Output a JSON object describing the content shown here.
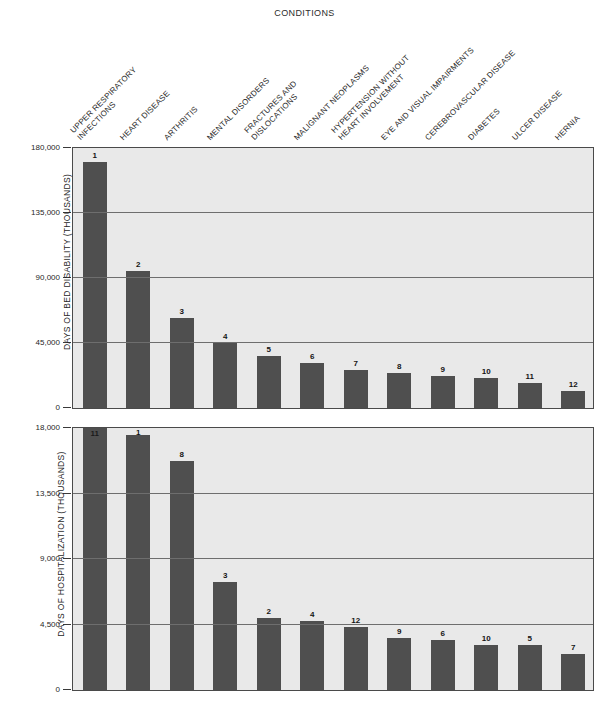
{
  "chart_title": "CONDITIONS",
  "categories": [
    {
      "rank": 1,
      "lines": [
        "UPPER RESPIRATORY",
        "INFECTIONS"
      ]
    },
    {
      "rank": 2,
      "lines": [
        "HEART DISEASE"
      ]
    },
    {
      "rank": 3,
      "lines": [
        "ARTHRITIS"
      ]
    },
    {
      "rank": 4,
      "lines": [
        "MENTAL DISORDERS"
      ]
    },
    {
      "rank": 5,
      "lines": [
        "FRACTURES AND",
        "DISLOCATIONS"
      ]
    },
    {
      "rank": 6,
      "lines": [
        "MALIGNANT NEOPLASMS"
      ]
    },
    {
      "rank": 7,
      "lines": [
        "HYPERTENSION WITHOUT",
        "HEART INVOLVEMENT"
      ]
    },
    {
      "rank": 8,
      "lines": [
        "EYE AND VISUAL IMPAIRMENTS"
      ]
    },
    {
      "rank": 9,
      "lines": [
        "CEREBROVASCULAR DISEASE"
      ]
    },
    {
      "rank": 10,
      "lines": [
        "DIABETES"
      ]
    },
    {
      "rank": 11,
      "lines": [
        "ULCER DISEASE"
      ]
    },
    {
      "rank": 12,
      "lines": [
        "HERNIA"
      ]
    }
  ],
  "colors": {
    "bar": "#4f4f4f",
    "plot_background": "#e9e9e9",
    "gridline": "#6e6e6e",
    "frame": "#4a4a4a",
    "text": "#1a1a1a"
  },
  "chart_data": [
    {
      "type": "bar",
      "id": "bed-disability",
      "title": "CONDITIONS",
      "xlabel": "CONDITIONS",
      "ylabel": "DAYS OF BED DISABILITY (THOUSANDS)",
      "ylim": [
        0,
        180000
      ],
      "yticks": [
        0,
        45000,
        90000,
        135000,
        180000
      ],
      "ytick_labels": [
        "0",
        "45,000",
        "90,000",
        "135,000",
        "180,000"
      ],
      "grid": true,
      "legend": "none",
      "categories": [
        "UPPER RESPIRATORY INFECTIONS",
        "HEART DISEASE",
        "ARTHRITIS",
        "MENTAL DISORDERS",
        "FRACTURES AND DISLOCATIONS",
        "MALIGNANT NEOPLASMS",
        "HYPERTENSION WITHOUT HEART INVOLVEMENT",
        "EYE AND VISUAL IMPAIRMENTS",
        "CEREBROVASCULAR DISEASE",
        "DIABETES",
        "ULCER DISEASE",
        "HERNIA"
      ],
      "values": [
        170000,
        95000,
        62000,
        45000,
        36000,
        31000,
        26500,
        24000,
        22000,
        21000,
        17000,
        12000
      ],
      "bar_annotations": [
        "1",
        "2",
        "3",
        "4",
        "5",
        "6",
        "7",
        "8",
        "9",
        "10",
        "11",
        "12"
      ]
    },
    {
      "type": "bar",
      "id": "hospitalization",
      "xlabel": "CONDITIONS",
      "ylabel": "DAYS OF HOSPITALIZATION (THOUSANDS)",
      "ylim": [
        0,
        18000
      ],
      "yticks": [
        0,
        4500,
        9000,
        13500,
        18000
      ],
      "ytick_labels": [
        "0",
        "4,500",
        "9,000",
        "13,500",
        "18,000"
      ],
      "grid": true,
      "legend": "none",
      "categories": [
        "UPPER RESPIRATORY INFECTIONS",
        "HEART DISEASE",
        "ARTHRITIS",
        "MENTAL DISORDERS",
        "FRACTURES AND DISLOCATIONS",
        "MALIGNANT NEOPLASMS",
        "HYPERTENSION WITHOUT HEART INVOLVEMENT",
        "EYE AND VISUAL IMPAIRMENTS",
        "CEREBROVASCULAR DISEASE",
        "DIABETES",
        "ULCER DISEASE",
        "HERNIA"
      ],
      "values": [
        18200,
        17500,
        15700,
        7400,
        4950,
        4750,
        4350,
        3600,
        3450,
        3100,
        3100,
        2500
      ],
      "bar_annotations": [
        "11",
        "1",
        "8",
        "3",
        "2",
        "4",
        "12",
        "9",
        "6",
        "10",
        "5",
        "7"
      ]
    }
  ]
}
